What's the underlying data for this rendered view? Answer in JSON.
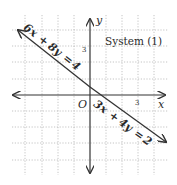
{
  "title": "System (1)",
  "axes": {
    "x_label": "x",
    "y_label": "y",
    "origin_label": "O",
    "x_tick_label": "3",
    "y_tick_label": "3"
  },
  "equations": {
    "eq1": {
      "lhs_a": "6x",
      "op": "+",
      "lhs_b": "8y",
      "eq": "=",
      "rhs": "4"
    },
    "eq2": {
      "lhs_a": "3x",
      "op": "+",
      "lhs_b": "4y",
      "eq": "=",
      "rhs": "2"
    }
  },
  "colors": {
    "line": "#333333",
    "grid": "#b5b5b5",
    "text": "#2a2a2a"
  }
}
